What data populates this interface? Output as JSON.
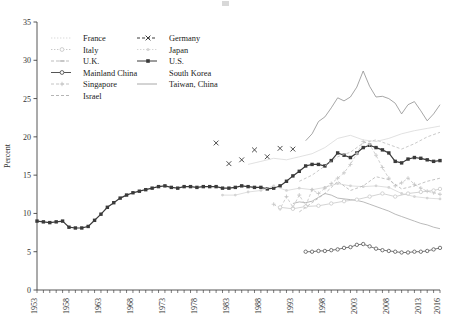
{
  "figure": {
    "top_mark": "",
    "ylabel": "Percent",
    "xlabel": ""
  },
  "legend": {
    "position": "upper-left-inside",
    "column1": [
      {
        "label": "France",
        "color": "#d9d9d9",
        "marker": "none",
        "dash": "dot"
      },
      {
        "label": "Italy",
        "color": "#c9c9c9",
        "marker": "circle",
        "dash": "dot"
      },
      {
        "label": "U.K.",
        "color": "#bdbdbd",
        "marker": "dash",
        "dash": "dash"
      },
      {
        "label": "Mainland China",
        "color": "#555555",
        "marker": "circle",
        "dash": "solid"
      },
      {
        "label": "Singapore",
        "color": "#c4c4c4",
        "marker": "plus",
        "dash": "dash"
      },
      {
        "label": "Israel",
        "color": "#b5b5b5",
        "marker": "none",
        "dash": "dash"
      }
    ],
    "column2": [
      {
        "label": "Germany",
        "color": "#3a3a3a",
        "marker": "x",
        "dash": "dash"
      },
      {
        "label": "Japan",
        "color": "#d5d5d5",
        "marker": "dot",
        "dash": "dot"
      },
      {
        "label": "U.S.",
        "color": "#3a3a3a",
        "marker": "square",
        "dash": "solid"
      },
      {
        "label": "South Korea",
        "color": "#ffffff",
        "marker": "none",
        "dash": "none"
      },
      {
        "label": "Taiwan, China",
        "color": "#a8a8a8",
        "marker": "none",
        "dash": "solid"
      }
    ]
  },
  "chart_data": {
    "type": "line",
    "title": "",
    "xlabel": "",
    "ylabel": "Percent",
    "xlim": [
      1953,
      2016
    ],
    "ylim": [
      0,
      35
    ],
    "yticks": [
      0,
      5,
      10,
      15,
      20,
      25,
      30,
      35
    ],
    "xticks": [
      1953,
      1958,
      1963,
      1968,
      1973,
      1978,
      1983,
      1988,
      1993,
      1998,
      2003,
      2008,
      2013,
      2016
    ],
    "grid": false,
    "legend_position": "upper left",
    "series": [
      {
        "name": "U.S.",
        "color": "#3a3a3a",
        "marker": "square",
        "x": [
          1953,
          1954,
          1955,
          1956,
          1957,
          1958,
          1959,
          1960,
          1961,
          1962,
          1963,
          1964,
          1965,
          1966,
          1967,
          1968,
          1969,
          1970,
          1971,
          1972,
          1973,
          1974,
          1975,
          1976,
          1977,
          1978,
          1979,
          1980,
          1981,
          1982,
          1983,
          1984,
          1985,
          1986,
          1987,
          1988,
          1989,
          1990,
          1991,
          1992,
          1993,
          1994,
          1995,
          1996,
          1997,
          1998,
          1999,
          2000,
          2001,
          2002,
          2003,
          2004,
          2005,
          2006,
          2007,
          2008,
          2009,
          2010,
          2011,
          2012,
          2013,
          2014,
          2015,
          2016
        ],
        "y": [
          9.0,
          8.9,
          8.8,
          8.9,
          9.0,
          8.2,
          8.1,
          8.1,
          8.3,
          9.1,
          9.9,
          10.8,
          11.4,
          12.0,
          12.4,
          12.7,
          12.9,
          13.1,
          13.3,
          13.5,
          13.6,
          13.4,
          13.3,
          13.5,
          13.5,
          13.4,
          13.5,
          13.5,
          13.5,
          13.3,
          13.3,
          13.4,
          13.6,
          13.5,
          13.4,
          13.4,
          13.2,
          13.3,
          13.6,
          14.2,
          14.9,
          15.5,
          16.2,
          16.4,
          16.4,
          16.2,
          16.9,
          17.9,
          17.6,
          17.3,
          17.9,
          18.6,
          18.9,
          18.6,
          18.3,
          17.9,
          16.8,
          16.6,
          17.1,
          17.3,
          17.2,
          17.0,
          16.8,
          16.9
        ]
      },
      {
        "name": "Germany",
        "color": "#3a3a3a",
        "marker": "x",
        "x": [
          1981,
          1983,
          1985,
          1987,
          1989,
          1991,
          1993
        ],
        "y": [
          19.2,
          16.5,
          17.0,
          18.3,
          17.4,
          18.5,
          18.4
        ]
      },
      {
        "name": "Japan",
        "color": "#d5d5d5",
        "marker": "dot",
        "x": [
          1982,
          1984,
          1986,
          1988,
          1990,
          1992,
          1994,
          1996,
          1998,
          2000,
          2002,
          2004,
          2006,
          2008,
          2010,
          2012,
          2014,
          2016
        ],
        "y": [
          12.4,
          12.4,
          12.8,
          13.0,
          13.6,
          13.0,
          13.3,
          13.1,
          13.4,
          13.9,
          13.6,
          13.5,
          13.6,
          13.4,
          12.6,
          12.2,
          12.0,
          11.9
        ]
      },
      {
        "name": "Mainland China",
        "color": "#555555",
        "marker": "circle",
        "x": [
          1995,
          1996,
          1997,
          1998,
          1999,
          2000,
          2001,
          2002,
          2003,
          2004,
          2005,
          2006,
          2007,
          2008,
          2009,
          2010,
          2011,
          2012,
          2013,
          2014,
          2015,
          2016
        ],
        "y": [
          5.0,
          5.0,
          5.1,
          5.1,
          5.2,
          5.3,
          5.5,
          5.6,
          5.9,
          6.0,
          5.7,
          5.4,
          5.2,
          5.1,
          5.0,
          4.9,
          4.9,
          5.0,
          5.0,
          5.1,
          5.3,
          5.5
        ]
      },
      {
        "name": "Taiwan, China",
        "color": "#a8a8a8",
        "marker": "none",
        "x": [
          1993,
          1994,
          1995,
          1996,
          1997,
          1998,
          1999,
          2000,
          2001,
          2002,
          2003,
          2004,
          2005,
          2006,
          2007,
          2008,
          2009,
          2010,
          2011,
          2012,
          2013,
          2014,
          2015,
          2016
        ],
        "y": [
          11.3,
          11.5,
          11.4,
          11.6,
          12.1,
          12.6,
          12.4,
          12.0,
          11.9,
          11.8,
          11.7,
          11.5,
          11.2,
          10.9,
          10.6,
          10.3,
          9.9,
          9.6,
          9.3,
          9.0,
          8.7,
          8.5,
          8.2,
          8.0
        ]
      },
      {
        "name": "South Korea",
        "color": "#8f8f8f",
        "marker": "none",
        "x": [
          1995,
          1996,
          1997,
          1998,
          1999,
          2000,
          2001,
          2002,
          2003,
          2004,
          2005,
          2006,
          2007,
          2008,
          2009,
          2010,
          2011,
          2012,
          2013,
          2014,
          2015,
          2016
        ],
        "y": [
          19.5,
          20.4,
          22.0,
          22.6,
          23.8,
          25.1,
          24.7,
          25.2,
          26.5,
          28.6,
          26.6,
          25.2,
          25.3,
          25.0,
          24.4,
          23.0,
          24.2,
          24.6,
          23.4,
          22.1,
          23.0,
          24.2
        ]
      },
      {
        "name": "Singapore",
        "color": "#c4c4c4",
        "marker": "plus",
        "x": [
          1990,
          1991,
          1992,
          1993,
          1994,
          1995,
          1996,
          1997,
          1998,
          1999,
          2000,
          2001,
          2002,
          2003,
          2004,
          2005,
          2006,
          2007,
          2008,
          2009,
          2010,
          2011,
          2012,
          2013,
          2014,
          2015,
          2016
        ],
        "y": [
          11.2,
          10.6,
          12.2,
          10.8,
          12.4,
          11.0,
          13.1,
          12.6,
          13.3,
          13.9,
          14.6,
          15.3,
          16.4,
          17.8,
          19.4,
          19.0,
          17.6,
          16.0,
          14.6,
          13.6,
          14.0,
          14.6,
          13.8,
          13.3,
          12.9,
          12.7,
          12.5
        ]
      },
      {
        "name": "Italy",
        "color": "#c9c9c9",
        "marker": "circle",
        "x": [
          1991,
          1993,
          1995,
          1997,
          1999,
          2001,
          2003,
          2005,
          2007,
          2009,
          2011,
          2013,
          2015,
          2016
        ],
        "y": [
          10.8,
          10.6,
          10.9,
          11.0,
          11.3,
          11.6,
          11.8,
          12.2,
          12.6,
          12.2,
          12.6,
          12.8,
          13.0,
          13.2
        ]
      },
      {
        "name": "U.K.",
        "color": "#bdbdbd",
        "marker": "dash",
        "x": [
          1994,
          1996,
          1998,
          2000,
          2002,
          2004,
          2006,
          2008,
          2010,
          2012,
          2014,
          2016
        ],
        "y": [
          14.2,
          15.0,
          16.2,
          17.4,
          18.0,
          19.2,
          19.6,
          19.0,
          18.4,
          19.1,
          20.0,
          20.6
        ]
      },
      {
        "name": "France",
        "color": "#d9d9d9",
        "marker": "none",
        "x": [
          1986,
          1988,
          1990,
          1992,
          1994,
          1996,
          1998,
          2000,
          2002,
          2004,
          2006,
          2008,
          2010,
          2012,
          2014,
          2016
        ],
        "y": [
          16.4,
          16.8,
          17.2,
          17.0,
          17.4,
          17.8,
          18.6,
          19.8,
          20.2,
          19.6,
          19.4,
          19.8,
          20.4,
          20.8,
          21.1,
          21.4
        ]
      },
      {
        "name": "Israel",
        "color": "#b5b5b5",
        "marker": "none",
        "x": [
          1994,
          1996,
          1998,
          2000,
          2002,
          2004,
          2006,
          2008,
          2010,
          2012,
          2014,
          2016
        ],
        "y": [
          10.2,
          11.4,
          12.6,
          14.2,
          13.0,
          13.6,
          14.8,
          14.4,
          13.2,
          13.6,
          14.2,
          14.6
        ]
      }
    ]
  }
}
